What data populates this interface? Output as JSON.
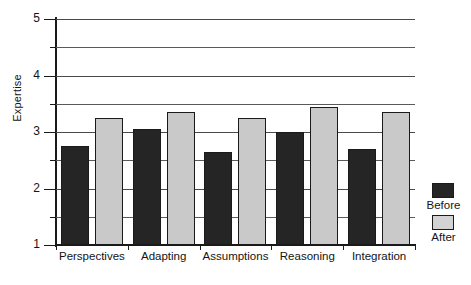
{
  "chart_data": {
    "type": "bar",
    "title": "",
    "xlabel": "",
    "ylabel": "Expertise",
    "ylim": [
      1,
      5
    ],
    "yticks": [
      1,
      2,
      3,
      4,
      5
    ],
    "ytick_labels": [
      "1",
      "2",
      "3",
      "4",
      "5"
    ],
    "gridlines": [
      1.5,
      2.0,
      2.5,
      3.0,
      3.5,
      4.0,
      4.5,
      5.0
    ],
    "grid": true,
    "legend_position": "right",
    "categories": [
      "Perspectives",
      "Adapting",
      "Assumptions",
      "Reasoning",
      "Integration"
    ],
    "series": [
      {
        "name": "Before",
        "color": "#252525",
        "values": [
          2.75,
          3.05,
          2.65,
          3.0,
          2.7
        ]
      },
      {
        "name": "After",
        "color": "#c9c9c9",
        "values": [
          3.25,
          3.35,
          3.25,
          3.45,
          3.35
        ]
      }
    ]
  },
  "legend": {
    "items": [
      {
        "label": "Before",
        "swatch": "dark-swatch"
      },
      {
        "label": "After",
        "swatch": "light-swatch"
      }
    ]
  },
  "axes": {
    "y_title": "Expertise"
  }
}
